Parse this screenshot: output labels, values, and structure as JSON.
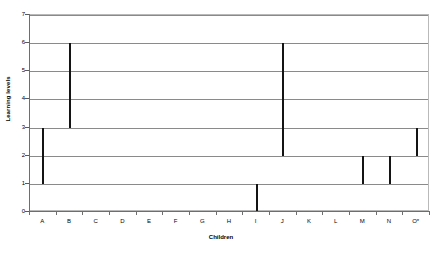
{
  "chart_data": {
    "type": "bar",
    "title": "",
    "subtitle": "",
    "xlabel": "Children",
    "ylabel": "Learning levels",
    "categories": [
      "A",
      "B",
      "C",
      "D",
      "E",
      "F",
      "G",
      "H",
      "I",
      "J",
      "K",
      "L",
      "M",
      "N",
      "O*"
    ],
    "ylim": [
      0,
      7
    ],
    "ytick_labels": [
      "0",
      "1",
      "2",
      "3",
      "4",
      "5",
      "6",
      "7"
    ],
    "yticks": [
      0,
      1,
      2,
      3,
      4,
      5,
      6,
      7
    ],
    "grid": true,
    "legend": "none",
    "bar_style": "floating-range",
    "series": [
      {
        "name": "Learning level range",
        "color": "#141414",
        "low": [
          1,
          3,
          null,
          null,
          null,
          null,
          null,
          null,
          0,
          2,
          null,
          null,
          1,
          1,
          2
        ],
        "high": [
          3,
          6,
          null,
          null,
          null,
          null,
          null,
          null,
          1,
          6,
          null,
          null,
          2,
          2,
          3
        ]
      }
    ],
    "bars": [
      {
        "category": "A",
        "low": 1,
        "high": 3
      },
      {
        "category": "B",
        "low": 3,
        "high": 6
      },
      {
        "category": "C",
        "low": null,
        "high": null
      },
      {
        "category": "D",
        "low": null,
        "high": null
      },
      {
        "category": "E",
        "low": null,
        "high": null
      },
      {
        "category": "F",
        "low": null,
        "high": null
      },
      {
        "category": "G",
        "low": null,
        "high": null
      },
      {
        "category": "H",
        "low": null,
        "high": null
      },
      {
        "category": "I",
        "low": 0,
        "high": 1
      },
      {
        "category": "J",
        "low": 2,
        "high": 6
      },
      {
        "category": "K",
        "low": null,
        "high": null
      },
      {
        "category": "L",
        "low": null,
        "high": null
      },
      {
        "category": "M",
        "low": 1,
        "high": 2
      },
      {
        "category": "N",
        "low": 1,
        "high": 2
      },
      {
        "category": "O*",
        "low": 2,
        "high": 3
      }
    ]
  },
  "colors": {
    "bar": "#141414",
    "gridline": "#8a8a8a",
    "axis": "#6e6e6e",
    "frame": "#b9b9b9",
    "background": "#ffffff",
    "text": "#000000"
  }
}
